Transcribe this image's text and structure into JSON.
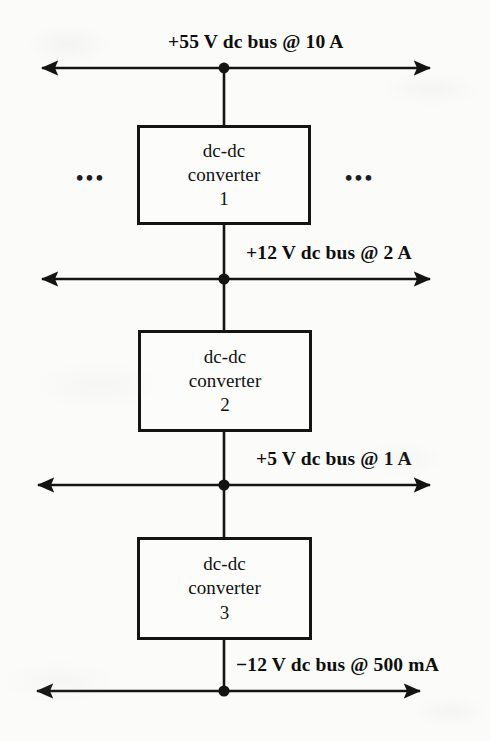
{
  "diagram": {
    "background_color": "#fbfbf9",
    "line_color": "#141414",
    "buses": [
      {
        "id": "bus-55v",
        "label": "+55 V dc bus @ 10 A",
        "voltage": "+55 V",
        "current": "10 A",
        "label_align": "center"
      },
      {
        "id": "bus-12v",
        "label": "+12 V dc bus @ 2 A",
        "voltage": "+12 V",
        "current": "2 A",
        "label_align": "right-of-center"
      },
      {
        "id": "bus-5v",
        "label": "+5 V dc bus @ 1 A",
        "voltage": "+5 V",
        "current": "1 A",
        "label_align": "right-of-center"
      },
      {
        "id": "bus-neg12v",
        "label": "−12 V dc bus @ 500 mA",
        "voltage": "−12 V",
        "current": "500 mA",
        "label_align": "right-of-center"
      }
    ],
    "converters": [
      {
        "id": "converter-1",
        "line1": "dc-dc",
        "line2": "converter",
        "line3": "1"
      },
      {
        "id": "converter-2",
        "line1": "dc-dc",
        "line2": "converter",
        "line3": "2"
      },
      {
        "id": "converter-3",
        "line1": "dc-dc",
        "line2": "converter",
        "line3": "3"
      }
    ],
    "ellipsis_left": "•••",
    "ellipsis_right": "•••"
  }
}
